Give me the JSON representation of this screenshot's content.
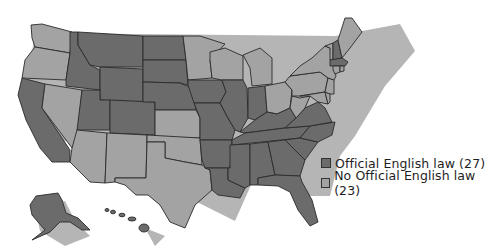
{
  "map": {
    "title": "",
    "colors": {
      "official": "#6b6b6b",
      "no_official": "#a3a3a3",
      "border": "#2a2a2a",
      "shadow": "#b5b5b5",
      "background": "#ffffff"
    },
    "legend": {
      "items": [
        {
          "label": "Official English law (27)",
          "color": "#6b6b6b",
          "count": 27
        },
        {
          "label": "No Official English law (23)",
          "color": "#a3a3a3",
          "count": 23
        }
      ]
    },
    "states_official": [
      "AK",
      "AL",
      "AZ",
      "AR",
      "CA",
      "CO",
      "FL",
      "GA",
      "HI",
      "ID",
      "IL",
      "IN",
      "IA",
      "KS",
      "KY",
      "LA",
      "MA",
      "MS",
      "MO",
      "MT",
      "NE",
      "NH",
      "NC",
      "ND",
      "OK",
      "SC",
      "SD",
      "TN",
      "UT",
      "VA",
      "WY"
    ],
    "states_no_official": [
      "CT",
      "DE",
      "ME",
      "MD",
      "MI",
      "MN",
      "NV",
      "NJ",
      "NM",
      "NY",
      "OH",
      "OR",
      "PA",
      "RI",
      "TX",
      "VT",
      "WA",
      "WV",
      "WI"
    ]
  }
}
